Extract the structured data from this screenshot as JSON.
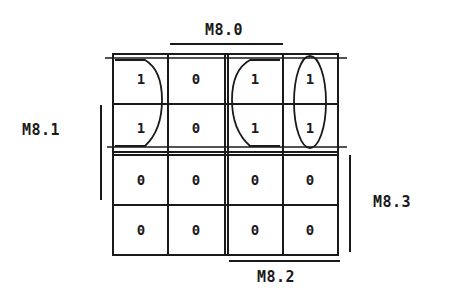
{
  "diagram": {
    "type": "karnaugh-map",
    "labels": {
      "top": "M8.0",
      "left": "M8.1",
      "right": "M8.3",
      "bottom": "M8.2"
    },
    "cells": [
      [
        "1",
        "0",
        "1",
        "1"
      ],
      [
        "1",
        "0",
        "1",
        "1"
      ],
      [
        "0",
        "0",
        "0",
        "0"
      ],
      [
        "0",
        "0",
        "0",
        "0"
      ]
    ],
    "groups": [
      {
        "name": "wraparound-group",
        "cells": [
          [
            0,
            0
          ],
          [
            1,
            0
          ],
          [
            0,
            2
          ],
          [
            1,
            2
          ]
        ],
        "shape": "split-loop"
      },
      {
        "name": "column-4-group",
        "cells": [
          [
            0,
            3
          ],
          [
            1,
            3
          ]
        ],
        "shape": "ellipse"
      }
    ],
    "line_color": "#1a1a1a"
  }
}
